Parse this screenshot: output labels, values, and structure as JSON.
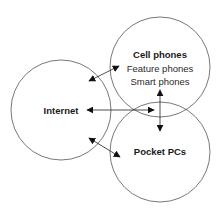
{
  "diagram": {
    "nodes": [
      {
        "id": "internet",
        "title": "Internet",
        "lines": []
      },
      {
        "id": "cell_phones",
        "title": "Cell phones",
        "lines": [
          "Feature phones",
          "Smart phones"
        ]
      },
      {
        "id": "pocket_pcs",
        "title": "Pocket PCs",
        "lines": []
      }
    ],
    "edges": [
      {
        "from": "internet",
        "to": "cell_phones",
        "type": "bidirectional"
      },
      {
        "from": "internet",
        "to": "pocket_pcs",
        "type": "bidirectional"
      },
      {
        "from": "internet",
        "to": "cell_phones/pocket_pcs intersection",
        "type": "bidirectional"
      },
      {
        "from": "cell_phones",
        "to": "pocket_pcs",
        "type": "bidirectional"
      }
    ]
  },
  "colors": {
    "stroke": "#555555",
    "arrow": "#111111",
    "text": "#1a1a1a"
  }
}
